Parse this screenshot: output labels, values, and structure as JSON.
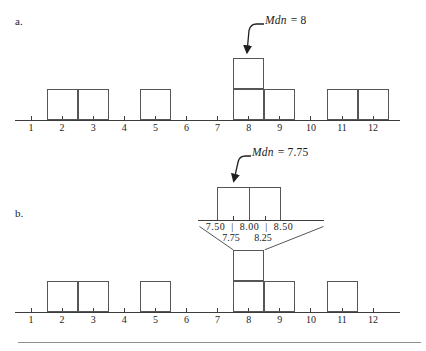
{
  "figure": {
    "panel_a": {
      "label": "a.",
      "median": {
        "var": "Mdn",
        "eq": "= 8"
      }
    },
    "panel_b": {
      "label": "b.",
      "median": {
        "var": "Mdn",
        "eq": "= 7.75"
      },
      "inset": {
        "scale_row": "7.50 | 8.00 | 8.50",
        "quarter_left": "7.75",
        "quarter_right": "8.25"
      }
    },
    "colors": {
      "line": "#3d3d3d",
      "box_border": "#565656",
      "text": "#1c1c1c",
      "bottom_rule": "#8f8f8f"
    }
  },
  "chart_data": [
    {
      "type": "bar",
      "panel": "a",
      "title": "Mdn = 8",
      "categories": [
        1,
        2,
        3,
        4,
        5,
        6,
        7,
        8,
        9,
        10,
        11,
        12
      ],
      "values": [
        0,
        1,
        1,
        0,
        1,
        0,
        0,
        2,
        1,
        0,
        1,
        1
      ],
      "scores": [
        2,
        3,
        5,
        8,
        8,
        9,
        11,
        12
      ],
      "median": 8,
      "annotation": "Mdn = 8",
      "xlabel": "",
      "ylabel": "",
      "xlim": [
        1,
        12
      ],
      "ylim": [
        0,
        2
      ],
      "grid": false,
      "legend": false
    },
    {
      "type": "bar",
      "panel": "b",
      "title": "Mdn = 7.75",
      "categories": [
        1,
        2,
        3,
        4,
        5,
        6,
        7,
        8,
        9,
        10,
        11,
        12
      ],
      "values": [
        0,
        1,
        1,
        0,
        1,
        0,
        0,
        2,
        1,
        0,
        1,
        0
      ],
      "scores": [
        2,
        3,
        5,
        8,
        8,
        9,
        11
      ],
      "median": 7.75,
      "annotation": "Mdn = 7.75",
      "inset_interval_labels": [
        "7.50",
        "8.00",
        "8.50"
      ],
      "inset_quarter_labels": [
        "7.75",
        "8.25"
      ],
      "xlabel": "",
      "ylabel": "",
      "xlim": [
        1,
        12
      ],
      "ylim": [
        0,
        2
      ],
      "grid": false,
      "legend": false
    }
  ]
}
